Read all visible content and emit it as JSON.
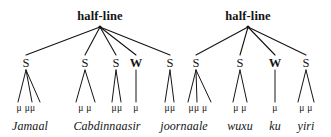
{
  "figure": {
    "ink_color": "#141414",
    "background_color": "#ffffff"
  },
  "halflines": [
    {
      "label": "half-line",
      "apex_x": 100,
      "apex_y": 27,
      "label_x": 100,
      "label_y": 10
    },
    {
      "label": "half-line",
      "apex_x": 248,
      "apex_y": 27,
      "label_x": 248,
      "label_y": 10
    }
  ],
  "nodes": [
    {
      "label": "S",
      "x": 26,
      "y": 57,
      "parent": 0,
      "morae": 3,
      "mora_text": "μ μμ",
      "mora_x": 26
    },
    {
      "label": "S",
      "x": 85,
      "y": 57,
      "parent": 0,
      "morae": 2,
      "mora_text": "μ  μ",
      "mora_x": 85
    },
    {
      "label": "S",
      "x": 116,
      "y": 57,
      "parent": 0,
      "morae": 2,
      "mora_text": "μμ",
      "mora_x": 117
    },
    {
      "label": "W",
      "x": 136,
      "y": 57,
      "parent": 0,
      "morae": 1,
      "mora_text": "μ",
      "mora_x": 136
    },
    {
      "label": "S",
      "x": 170,
      "y": 57,
      "parent": 0,
      "morae": 2,
      "mora_text": "μμ",
      "mora_x": 170
    },
    {
      "label": "S",
      "x": 196,
      "y": 57,
      "parent": 1,
      "morae": 3,
      "mora_text": "μμ μ",
      "mora_x": 198
    },
    {
      "label": "S",
      "x": 240,
      "y": 57,
      "parent": 1,
      "morae": 2,
      "mora_text": "μ μ",
      "mora_x": 240
    },
    {
      "label": "W",
      "x": 275,
      "y": 57,
      "parent": 1,
      "morae": 1,
      "mora_text": "μ",
      "mora_x": 275
    },
    {
      "label": "S",
      "x": 306,
      "y": 57,
      "parent": 1,
      "morae": 2,
      "mora_text": "μ μ",
      "mora_x": 306
    }
  ],
  "mora_row_y": 104,
  "word_row_y": 120,
  "words": [
    {
      "text": "Jamaal",
      "x": 30,
      "spans_nodes": [
        0
      ]
    },
    {
      "text": "Cabdinnaasir",
      "x": 107,
      "spans_nodes": [
        1,
        2,
        3
      ]
    },
    {
      "text": "joornaale",
      "x": 184,
      "spans_nodes": [
        4,
        5
      ]
    },
    {
      "text": "wuxu",
      "x": 240,
      "spans_nodes": [
        6
      ]
    },
    {
      "text": "ku",
      "x": 275,
      "spans_nodes": [
        7
      ]
    },
    {
      "text": "yiri",
      "x": 306,
      "spans_nodes": [
        8
      ]
    }
  ],
  "mora_leaves": [
    {
      "node": 0,
      "x": 18
    },
    {
      "node": 0,
      "x": 32
    },
    {
      "node": 0,
      "x": 40
    },
    {
      "node": 1,
      "x": 76
    },
    {
      "node": 1,
      "x": 95
    },
    {
      "node": 2,
      "x": 112
    },
    {
      "node": 2,
      "x": 121
    },
    {
      "node": 3,
      "x": 136
    },
    {
      "node": 4,
      "x": 165
    },
    {
      "node": 4,
      "x": 174
    },
    {
      "node": 5,
      "x": 188
    },
    {
      "node": 5,
      "x": 197
    },
    {
      "node": 5,
      "x": 211
    },
    {
      "node": 6,
      "x": 233
    },
    {
      "node": 6,
      "x": 247
    },
    {
      "node": 7,
      "x": 275
    },
    {
      "node": 8,
      "x": 298
    },
    {
      "node": 8,
      "x": 314
    }
  ]
}
